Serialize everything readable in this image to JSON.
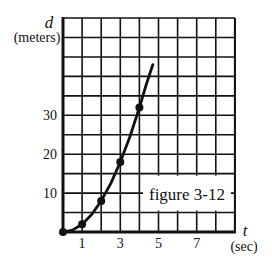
{
  "figure": {
    "caption": "figure 3-12"
  },
  "axes": {
    "y_var": "d",
    "y_unit": "(meters)",
    "x_var": "t",
    "x_unit": "(sec)"
  },
  "colors": {
    "ink": "#111111",
    "background": "#ffffff"
  },
  "chart_data": {
    "type": "line",
    "title": "figure 3-12",
    "xlabel": "t (sec)",
    "ylabel": "d (meters)",
    "xlim": [
      0,
      9
    ],
    "ylim": [
      0,
      55
    ],
    "x_ticks": [
      1,
      3,
      5,
      7
    ],
    "y_ticks": [
      10,
      20,
      30
    ],
    "grid": {
      "on": true,
      "x_step": 1,
      "y_step": 5
    },
    "legend": null,
    "series": [
      {
        "name": "measured points",
        "style": "markers",
        "x": [
          0,
          1,
          2,
          3,
          4
        ],
        "y": [
          0,
          2,
          8,
          18,
          32
        ]
      },
      {
        "name": "curve",
        "style": "line",
        "x": [
          0,
          0.5,
          1,
          1.5,
          2,
          2.5,
          3,
          3.5,
          4,
          4.35,
          4.7
        ],
        "y": [
          0,
          0.5,
          2,
          4.5,
          8,
          12.5,
          18,
          24.5,
          32,
          37.8,
          43
        ]
      }
    ]
  }
}
